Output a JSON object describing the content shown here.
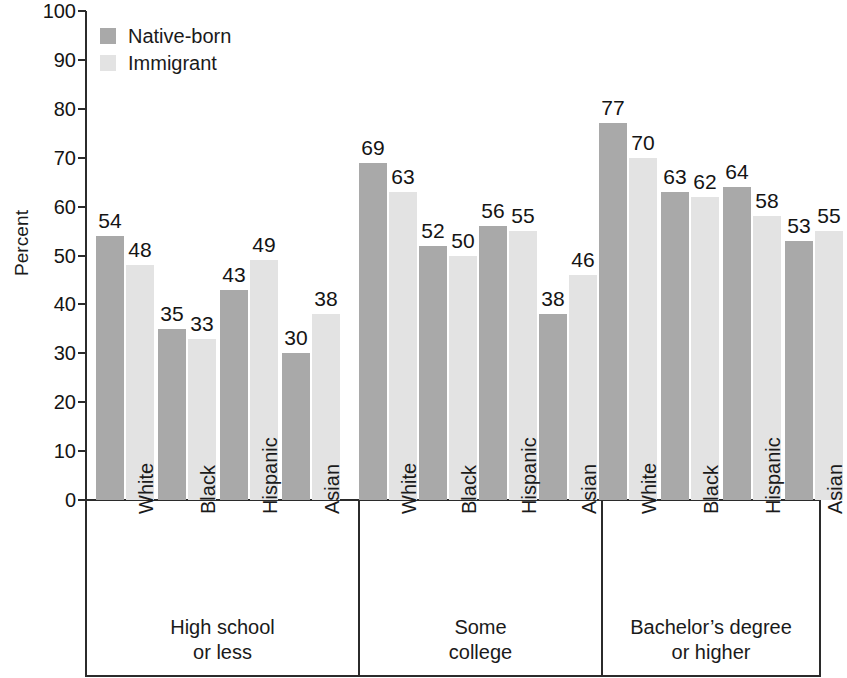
{
  "chart_data": {
    "type": "bar",
    "title": "",
    "xlabel": "",
    "ylabel": "Percent",
    "ylim": [
      0,
      100
    ],
    "ytick_step": 10,
    "yticks": [
      100,
      90,
      80,
      70,
      60,
      50,
      40,
      30,
      20,
      10,
      0
    ],
    "grid": false,
    "legend_position": "top-left",
    "categories": [
      "White",
      "Black",
      "Hispanic",
      "Asian"
    ],
    "groups": [
      {
        "label_lines": [
          "High school",
          "or less"
        ],
        "label": "High school or less",
        "categories": [
          "White",
          "Black",
          "Hispanic",
          "Asian"
        ],
        "series": [
          {
            "name": "Native-born",
            "values": [
              54,
              35,
              43,
              30
            ]
          },
          {
            "name": "Immigrant",
            "values": [
              48,
              33,
              49,
              38
            ]
          }
        ]
      },
      {
        "label_lines": [
          "Some",
          "college"
        ],
        "label": "Some college",
        "categories": [
          "White",
          "Black",
          "Hispanic",
          "Asian"
        ],
        "series": [
          {
            "name": "Native-born",
            "values": [
              69,
              52,
              56,
              38
            ]
          },
          {
            "name": "Immigrant",
            "values": [
              63,
              50,
              55,
              46
            ]
          }
        ]
      },
      {
        "label_lines": [
          "Bachelor’s degree",
          "or higher"
        ],
        "label": "Bachelor’s degree or higher",
        "categories": [
          "White",
          "Black",
          "Hispanic",
          "Asian"
        ],
        "series": [
          {
            "name": "Native-born",
            "values": [
              77,
              63,
              64,
              53
            ]
          },
          {
            "name": "Immigrant",
            "values": [
              70,
              62,
              58,
              55
            ]
          }
        ]
      }
    ],
    "series_colors": {
      "Native-born": "#a9a9a9",
      "Immigrant": "#e3e3e3"
    }
  },
  "legend": {
    "items": [
      {
        "label": "Native-born",
        "color": "#a9a9a9"
      },
      {
        "label": "Immigrant",
        "color": "#e3e3e3"
      }
    ]
  },
  "axis": {
    "y_title": "Percent",
    "y_labels": [
      "100",
      "90",
      "80",
      "70",
      "60",
      "50",
      "40",
      "30",
      "20",
      "10",
      "0"
    ],
    "axis_color": "#2b2b2b"
  }
}
